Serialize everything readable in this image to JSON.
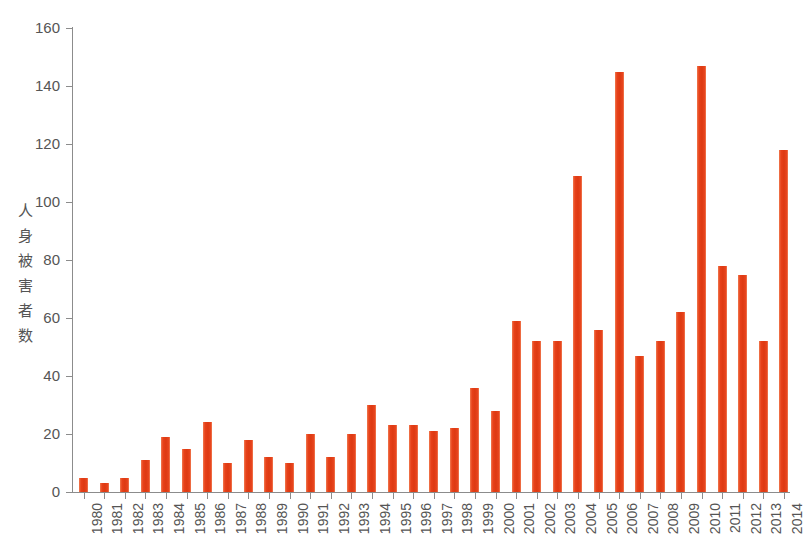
{
  "chart_data": {
    "type": "bar",
    "title": "",
    "xlabel": "",
    "ylabel": "人身被害者数",
    "ylim": [
      0,
      160
    ],
    "yticks": [
      0,
      20,
      40,
      60,
      80,
      100,
      120,
      140,
      160
    ],
    "grid": false,
    "legend": false,
    "bar_color": "#e8441c",
    "axis_color": "#8c8c8c",
    "text_color": "#555555",
    "categories": [
      "1980",
      "1981",
      "1982",
      "1983",
      "1984",
      "1985",
      "1986",
      "1987",
      "1988",
      "1989",
      "1990",
      "1991",
      "1992",
      "1993",
      "1994",
      "1995",
      "1996",
      "1997",
      "1998",
      "1999",
      "2000",
      "2001",
      "2002",
      "2003",
      "2004",
      "2005",
      "2006",
      "2007",
      "2008",
      "2009",
      "2010",
      "2011",
      "2012",
      "2013",
      "2014"
    ],
    "values": [
      5,
      3,
      5,
      11,
      19,
      15,
      24,
      10,
      18,
      12,
      10,
      20,
      12,
      20,
      30,
      23,
      23,
      21,
      22,
      36,
      28,
      59,
      52,
      52,
      109,
      56,
      145,
      47,
      52,
      62,
      147,
      78,
      75,
      52,
      118
    ]
  }
}
